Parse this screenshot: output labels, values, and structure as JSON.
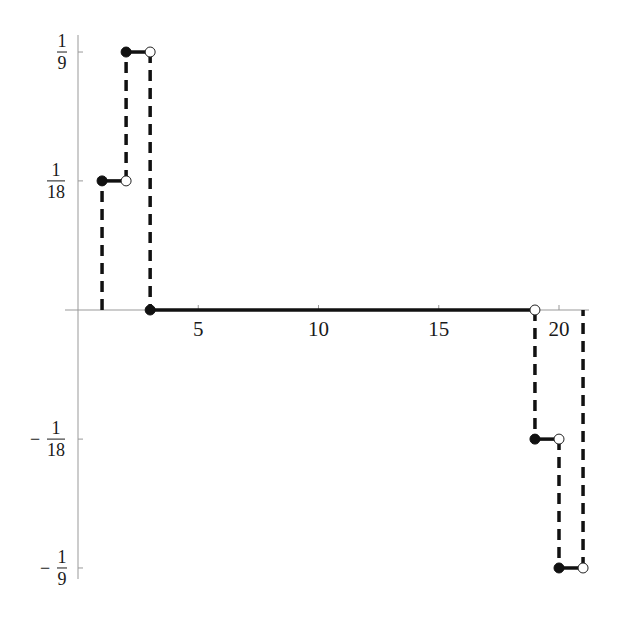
{
  "chart_data": {
    "type": "line",
    "style": "step function (dashed vertical jumps, solid horizontal segments, filled left endpoints, open right endpoints)",
    "title": "",
    "xlabel": "",
    "ylabel": "",
    "xlim": [
      -0.5,
      21.5
    ],
    "ylim": [
      -0.1111,
      0.1111
    ],
    "grid": false,
    "legend": null,
    "x_ticks": [
      {
        "value": 5,
        "label": "5"
      },
      {
        "value": 10,
        "label": "10"
      },
      {
        "value": 15,
        "label": "15"
      },
      {
        "value": 20,
        "label": "20"
      }
    ],
    "y_ticks": [
      {
        "value": 0.1111,
        "label_num": "1",
        "label_den": "9",
        "sign": ""
      },
      {
        "value": 0.0556,
        "label_num": "1",
        "label_den": "18",
        "sign": ""
      },
      {
        "value": -0.0556,
        "label_num": "1",
        "label_den": "18",
        "sign": "−"
      },
      {
        "value": -0.1111,
        "label_num": "1",
        "label_den": "9",
        "sign": "−"
      }
    ],
    "segments": [
      {
        "x_start": 1,
        "x_end": 2,
        "y": 0.0556,
        "y_label": "1/18"
      },
      {
        "x_start": 2,
        "x_end": 3,
        "y": 0.1111,
        "y_label": "1/9"
      },
      {
        "x_start": 3,
        "x_end": 19,
        "y": 0,
        "y_label": "0"
      },
      {
        "x_start": 19,
        "x_end": 20,
        "y": -0.0556,
        "y_label": "-1/18"
      },
      {
        "x_start": 20,
        "x_end": 21,
        "y": -0.1111,
        "y_label": "-1/9"
      }
    ],
    "jumps": [
      {
        "x": 1,
        "from": 0,
        "to": 0.0556
      },
      {
        "x": 2,
        "from": 0.0556,
        "to": 0.1111
      },
      {
        "x": 3,
        "from": 0.1111,
        "to": 0
      },
      {
        "x": 19,
        "from": 0,
        "to": -0.0556
      },
      {
        "x": 20,
        "from": -0.0556,
        "to": -0.1111
      },
      {
        "x": 21,
        "from": -0.1111,
        "to": 0
      }
    ]
  }
}
